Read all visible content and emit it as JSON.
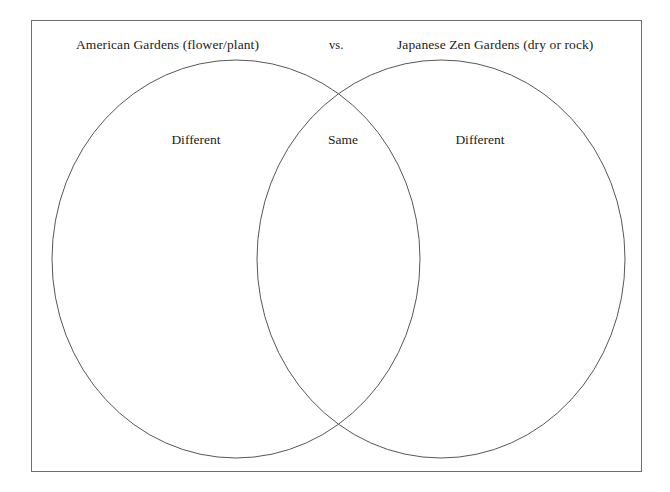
{
  "diagram": {
    "type": "venn",
    "kind": "two-circle-compare-contrast",
    "frame_border_color": "#6e6e6e",
    "ellipse_stroke_color": "#57575a",
    "background_color": "#ffffff",
    "text_color": "#1b1b1b"
  },
  "headings": {
    "left": "American Gardens (flower/plant)",
    "connector": "vs.",
    "right": "Japanese Zen Gardens (dry or rock)"
  },
  "regions": {
    "left_only": "Different",
    "overlap": "Same",
    "right_only": "Different"
  },
  "geometry": {
    "frame": {
      "x": 31,
      "y": 20,
      "width": 611,
      "height": 452
    },
    "left_ellipse": {
      "cx": 236,
      "cy": 259,
      "rx": 184,
      "ry": 199
    },
    "right_ellipse": {
      "cx": 441,
      "cy": 259,
      "rx": 184,
      "ry": 199
    }
  }
}
